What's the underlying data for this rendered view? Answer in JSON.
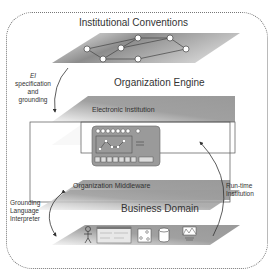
{
  "layers": {
    "institutional_conventions": "Institutional Conventions",
    "organization_engine": "Organization Engine",
    "electronic_institution": "Electronic Institution",
    "organization_middleware": "Organization  Middleware",
    "business_domain": "Business Domain"
  },
  "arrows": {
    "ei_spec": {
      "line1": "EI",
      "line2": "specification",
      "line3": "and",
      "line4": "grounding"
    },
    "grounding_lang": {
      "line1": "Grounding",
      "line2": "Language",
      "line3": "Interpreter"
    },
    "runtime": {
      "line1": "Run-time",
      "line2": "Institution"
    }
  },
  "colors": {
    "plane_dark": "#8a8a8a",
    "plane_light": "#f4f4f4",
    "border": "#777777"
  }
}
